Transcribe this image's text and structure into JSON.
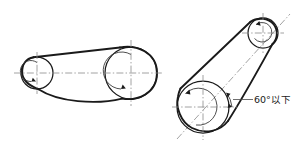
{
  "figure": {
    "background_color": "#ffffff",
    "line_color": "#1a1a1a",
    "centerline_color": "#8a8a8a",
    "annotations": [
      {
        "id": "max-angle",
        "text": "60°以下",
        "meaning": "60 degrees or less",
        "x": 254,
        "y": 101
      }
    ]
  },
  "diagrams": [
    {
      "id": "horizontal-drive",
      "name": "Horizontal belt drive arrangement",
      "pulleys": [
        {
          "id": "left-small-pulley",
          "role": "driver",
          "cx": 37,
          "cy": 73,
          "r": 16,
          "rotation": "clockwise",
          "has_rotation_arrow": true
        },
        {
          "id": "left-large-pulley",
          "role": "driven",
          "cx": 131,
          "cy": 73,
          "r": 26,
          "rotation": "clockwise",
          "has_rotation_arrow": true
        }
      ],
      "centerline": {
        "x1": 14,
        "y1": 73,
        "x2": 163,
        "y2": 73
      },
      "belt_note": "taut upper span, sagging lower span"
    },
    {
      "id": "inclined-drive",
      "name": "Inclined belt drive arrangement",
      "pulleys": [
        {
          "id": "right-large-pulley",
          "role": "driver",
          "cx": 203,
          "cy": 107,
          "r": 26,
          "rotation": "counter-clockwise",
          "has_rotation_arrow": true
        },
        {
          "id": "right-small-pulley",
          "role": "driven",
          "cx": 263,
          "cy": 33,
          "r": 15,
          "rotation": "clockwise",
          "has_rotation_arrow": true
        }
      ],
      "incline_axis": {
        "x1": 176,
        "y1": 139,
        "x2": 289,
        "y2": 15
      },
      "horizontal_reference": {
        "x1": 174,
        "y1": 107,
        "x2": 236,
        "y2": 107
      },
      "angle_dimension": {
        "label": "60°以下",
        "value": 60,
        "unit": "degrees",
        "qualifier": "以下",
        "between": [
          "horizontal_reference",
          "incline_axis"
        ]
      }
    }
  ]
}
